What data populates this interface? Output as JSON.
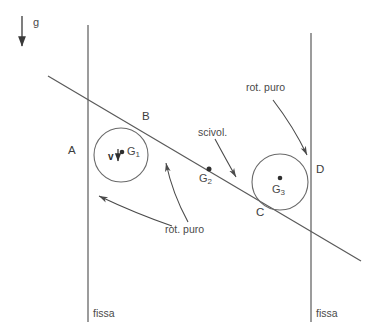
{
  "figure": {
    "background_color": "#ffffff",
    "stroke_color": "#555555",
    "text_color": "#4a4a4a"
  },
  "gravity": {
    "label": "g",
    "arrow_name": "gravity-arrow",
    "direction": "down"
  },
  "labels": {
    "point_a": "A",
    "point_b": "B",
    "point_c": "C",
    "point_d": "D",
    "center_g1": "G",
    "center_g1_sub": "1",
    "center_g2": "G",
    "center_g2_sub": "2",
    "center_g3": "G",
    "center_g3_sub": "3",
    "velocity": "v",
    "wall_left": "fissa",
    "wall_right": "fissa",
    "rot_puro_top": "rot. puro",
    "rot_puro_bottom": "rot. puro",
    "scivol": "scivol."
  },
  "geometry": {
    "left_wall": {
      "x": 88,
      "y_top": 25,
      "y_bottom": 322
    },
    "right_wall": {
      "x": 311,
      "y_top": 33,
      "y_bottom": 322
    },
    "incline": {
      "x1": 48,
      "y1": 76,
      "x2": 361,
      "y2": 261
    },
    "circle_1": {
      "cx": 121,
      "cy": 155,
      "r": 27
    },
    "circle_3": {
      "cx": 280,
      "cy": 182,
      "r": 28
    },
    "point_g2": {
      "x": 209,
      "y": 169
    }
  }
}
